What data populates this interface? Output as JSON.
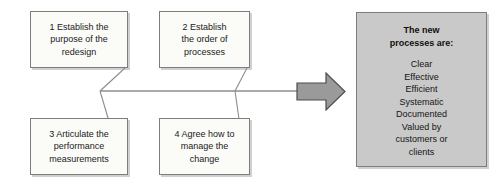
{
  "diagram": {
    "type": "fishbone-process-diagram",
    "colors": {
      "step_box_fill": "#fbfbf8",
      "outcome_box_fill": "#c9c9c9",
      "arrow_fill": "#9a9a9a",
      "line_stroke": "#8c8c8c",
      "border": "#7d7d7d",
      "text": "#1a1a1a"
    },
    "steps": [
      {
        "id": "step-1",
        "number": "1",
        "label": "1 Establish the\npurpose of the\nredesign"
      },
      {
        "id": "step-2",
        "number": "2",
        "label": "2 Establish\nthe order of\nprocesses"
      },
      {
        "id": "step-3",
        "number": "3",
        "label": "3 Articulate the\nperformance\nmeasurements"
      },
      {
        "id": "step-4",
        "number": "4",
        "label": "4 Agree how to\nmanage the\nchange"
      }
    ],
    "outcome": {
      "heading": "The new\nprocesses are:",
      "items": [
        "Clear",
        "Effective",
        "Efficient",
        "Systematic",
        "Documented",
        "Valued by\ncustomers or\nclients"
      ]
    },
    "arrow": {
      "name": "right-arrow-icon",
      "direction": "right"
    }
  }
}
